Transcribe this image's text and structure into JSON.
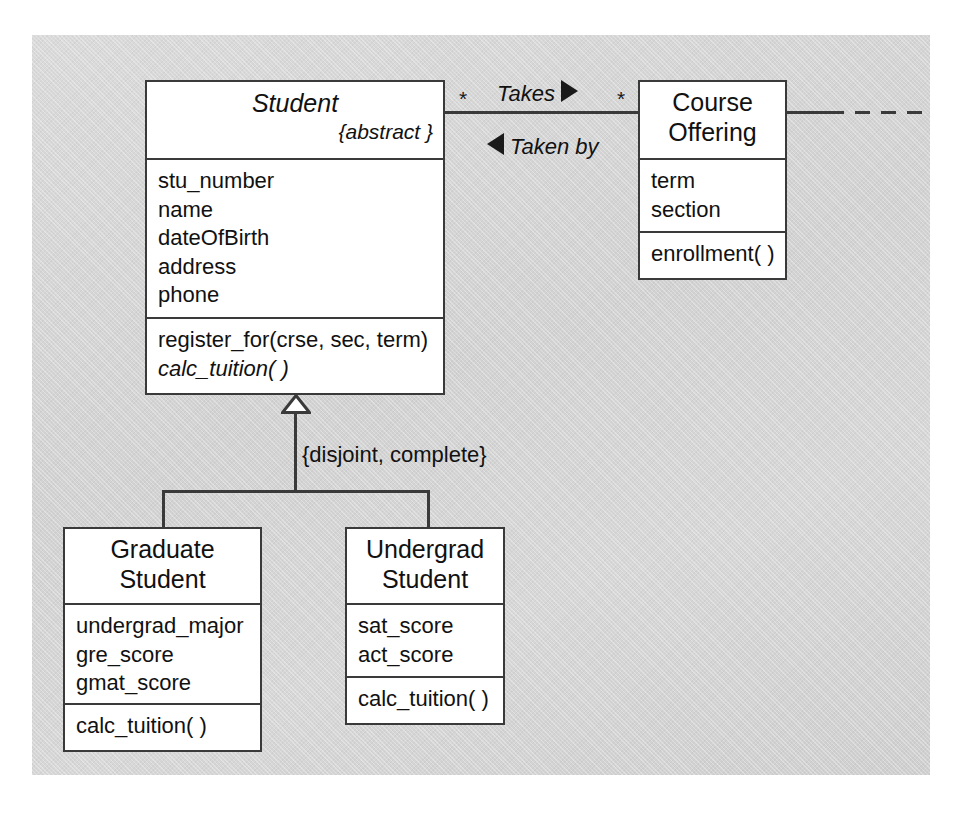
{
  "diagram": {
    "kind": "uml-class-diagram",
    "background_color": "#d5d5d5",
    "line_color": "#3a3a3a",
    "box_fill": "#ffffff"
  },
  "classes": {
    "student": {
      "name": "Student",
      "name_italic": true,
      "abstract_marker": "{abstract }",
      "attributes": [
        "stu_number",
        "name",
        "dateOfBirth",
        "address",
        "phone"
      ],
      "operations": [
        {
          "label": "register_for(crse, sec, term)",
          "italic": false
        },
        {
          "label": "calc_tuition( )",
          "italic": true
        }
      ]
    },
    "course_offering": {
      "name_line1": "Course",
      "name_line2": "Offering",
      "name_italic": false,
      "attributes": [
        "term",
        "section"
      ],
      "operations": [
        {
          "label": "enrollment( )",
          "italic": false
        }
      ]
    },
    "graduate_student": {
      "name_line1": "Graduate",
      "name_line2": "Student",
      "attributes": [
        "undergrad_major",
        "gre_score",
        "gmat_score"
      ],
      "operations": [
        {
          "label": "calc_tuition( )",
          "italic": false
        }
      ]
    },
    "undergrad_student": {
      "name_line1": "Undergrad",
      "name_line2": "Student",
      "attributes": [
        "sat_score",
        "act_score"
      ],
      "operations": [
        {
          "label": "calc_tuition( )",
          "italic": false
        }
      ]
    }
  },
  "association": {
    "name_forward": "Takes",
    "name_reverse": "Taken by",
    "multiplicity_student_end": "*",
    "multiplicity_course_end": "*",
    "forward_arrow": "solid-right-triangle",
    "reverse_arrow": "solid-left-triangle"
  },
  "generalization": {
    "constraint": "{disjoint, complete}",
    "arrowhead": "hollow-triangle",
    "superclass": "Student",
    "subclasses": [
      "Graduate Student",
      "Undergrad Student"
    ]
  }
}
